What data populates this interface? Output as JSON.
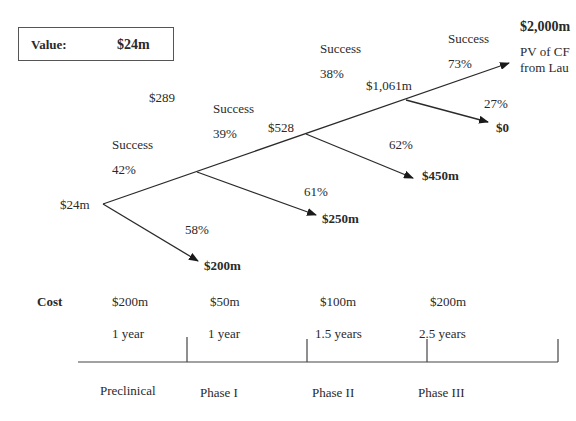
{
  "value_box": {
    "label": "Value:",
    "value": "$24m"
  },
  "tree": {
    "root_value": "$24m",
    "stages": [
      {
        "success_label": "Success",
        "success_pct": "42%",
        "fail_pct": "58%",
        "fail_payoff": "$200m",
        "node_value": "$289"
      },
      {
        "success_label": "Success",
        "success_pct": "39%",
        "fail_pct": "61%",
        "fail_payoff": "$250m",
        "node_value": "$528"
      },
      {
        "success_label": "Success",
        "success_pct": "38%",
        "fail_pct": "62%",
        "fail_payoff": "$450m",
        "node_value": "$1,061m"
      },
      {
        "success_label": "Success",
        "success_pct": "73%",
        "fail_pct": "27%",
        "fail_payoff": "$0"
      }
    ],
    "final_payoff": "$2,000m",
    "final_note_line1": "PV of CF",
    "final_note_line2": "from Lau"
  },
  "timeline": {
    "cost_label": "Cost",
    "phases": [
      {
        "name": "Preclinical",
        "cost": "$200m",
        "duration": "1 year"
      },
      {
        "name": "Phase I",
        "cost": "$50m",
        "duration": "1 year"
      },
      {
        "name": "Phase II",
        "cost": "$100m",
        "duration": "1.5 years"
      },
      {
        "name": "Phase III",
        "cost": "$200m",
        "duration": "2.5 years"
      }
    ]
  },
  "colors": {
    "line": "#2a2a2a",
    "text": "#2a2a2a"
  }
}
